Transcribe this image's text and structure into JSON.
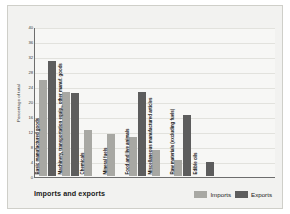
{
  "chart_data": {
    "type": "bar",
    "title": "Imports and exports",
    "xlabel": "",
    "ylabel": "Percentage of total",
    "ylim": [
      0,
      40
    ],
    "yticks": [
      0,
      4,
      8,
      12,
      16,
      20,
      24,
      28,
      32,
      36,
      40
    ],
    "grid": true,
    "legend_position": "bottom-right",
    "categories": [
      "Basic manufactured goods",
      "Machinery, transportation equip., other manuf. goods",
      "Chemicals",
      "Mineral fuels",
      "Food and live animals",
      "Miscellaneous manufactured articles",
      "Raw materials (excluding fuels)",
      "Edible oils"
    ],
    "series": [
      {
        "name": "Imports",
        "color": "#a8a8a3",
        "values": [
          25.5,
          22.5,
          12.4,
          11.2,
          10.3,
          7.0,
          4.2,
          0
        ]
      },
      {
        "name": "Exports",
        "color": "#5d5d5d",
        "values": [
          30.8,
          22.2,
          0,
          0,
          22.5,
          0,
          16.4,
          3.8
        ]
      }
    ]
  },
  "legend": {
    "items": [
      {
        "label": "Imports",
        "color": "#a8a8a3"
      },
      {
        "label": "Exports",
        "color": "#5d5d5d"
      }
    ]
  }
}
